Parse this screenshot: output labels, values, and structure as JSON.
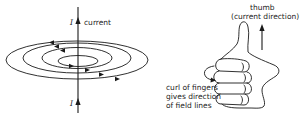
{
  "left_figure": {
    "current_symbol_top": "I",
    "current_label": "current",
    "current_symbol_bottom": "I"
  },
  "right_figure": {
    "thumb_label": "thumb",
    "thumb_sub_label": "(current direction)",
    "curl_label_lines": [
      "curl of fingers",
      "gives direction",
      "of field lines"
    ]
  },
  "colors": {
    "line": "#1a1a1a",
    "background": "#ffffff"
  }
}
